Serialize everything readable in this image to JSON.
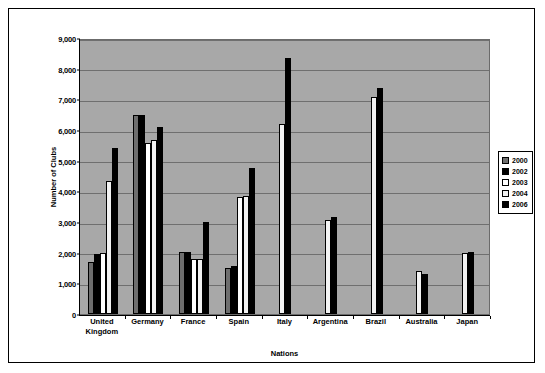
{
  "chart_data": {
    "type": "bar",
    "title": "",
    "subtitle": "",
    "xlabel": "Nations",
    "ylabel": "Number of Clubs",
    "ylim": [
      0,
      9000
    ],
    "ytick_labels": [
      "0",
      "1,000",
      "2,000",
      "3,000",
      "4,000",
      "5,000",
      "6,000",
      "7,000",
      "8,000",
      "9,000"
    ],
    "ytick_values": [
      0,
      1000,
      2000,
      3000,
      4000,
      5000,
      6000,
      7000,
      8000,
      9000
    ],
    "grid": true,
    "legend_position": "right",
    "categories": [
      "United Kingdom",
      "Germany",
      "France",
      "Spain",
      "Italy",
      "Argentina",
      "Brazil",
      "Australia",
      "Japan"
    ],
    "series": [
      {
        "name": "2000",
        "values": [
          1680,
          6500,
          2010,
          1500,
          null,
          null,
          null,
          null,
          null
        ]
      },
      {
        "name": "2002",
        "values": [
          1960,
          6500,
          2010,
          1560,
          null,
          null,
          null,
          null,
          null
        ]
      },
      {
        "name": "2003",
        "values": [
          2000,
          5570,
          1800,
          3830,
          null,
          null,
          null,
          null,
          null
        ]
      },
      {
        "name": "2004",
        "values": [
          4340,
          5680,
          1810,
          3840,
          6200,
          3050,
          7080,
          1400,
          2000
        ]
      },
      {
        "name": "2006",
        "values": [
          5400,
          6100,
          3000,
          4750,
          8350,
          3150,
          7380,
          1320,
          2020
        ]
      }
    ]
  },
  "legend": {
    "items": [
      {
        "label": "2000",
        "key": "s2000"
      },
      {
        "label": "2002",
        "key": "s2002"
      },
      {
        "label": "2003",
        "key": "s2003"
      },
      {
        "label": "2004",
        "key": "s2004"
      },
      {
        "label": "2006",
        "key": "s2006"
      }
    ]
  }
}
